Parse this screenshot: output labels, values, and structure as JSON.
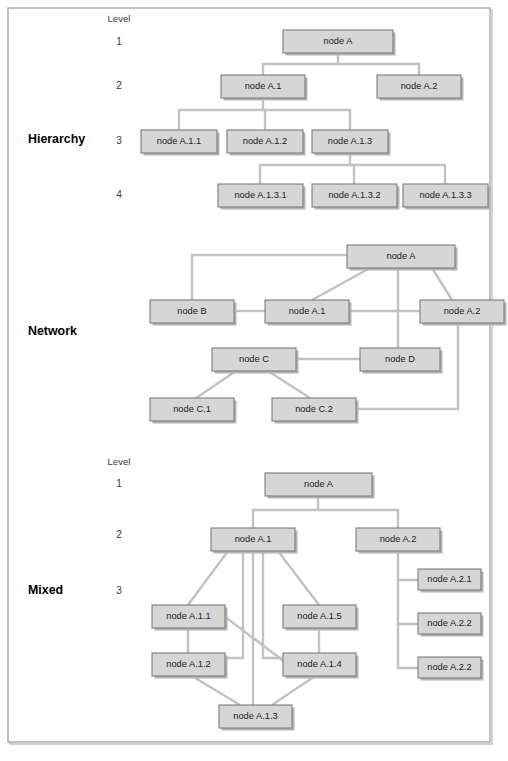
{
  "figure": {
    "width": 508,
    "height": 761,
    "colors": {
      "background": "#ffffff",
      "frame_border": "#9a9a9a",
      "node_fill": "#d6d6d6",
      "node_border": "#7d7d7d",
      "node_shadow": "#b4b4b4",
      "edge": "#c2c2c2",
      "label_text": "#1b1b1b",
      "row_title_text": "#000000",
      "level_text": "#3a3a3a"
    },
    "frame": {
      "x": 8,
      "y": 8,
      "width": 482,
      "height": 734
    }
  },
  "sections": [
    {
      "id": "hierarchy",
      "title": "Hierarchy",
      "title_pos": {
        "x": 28,
        "y": 140
      },
      "level_header": {
        "label": "Level",
        "x": 119,
        "y": 19
      },
      "levels": [
        {
          "label": "1",
          "x": 119,
          "y": 42
        },
        {
          "label": "2",
          "x": 119,
          "y": 86
        },
        {
          "label": "3",
          "x": 119,
          "y": 141
        },
        {
          "label": "4",
          "x": 119,
          "y": 195
        }
      ],
      "nodes": [
        {
          "id": "h-a",
          "label": "node A",
          "x": 283,
          "y": 30,
          "w": 110,
          "h": 23
        },
        {
          "id": "h-a1",
          "label": "node A.1",
          "x": 221,
          "y": 75,
          "w": 84,
          "h": 23
        },
        {
          "id": "h-a2",
          "label": "node A.2",
          "x": 377,
          "y": 75,
          "w": 84,
          "h": 23
        },
        {
          "id": "h-a11",
          "label": "node A.1.1",
          "x": 141,
          "y": 130,
          "w": 76,
          "h": 23
        },
        {
          "id": "h-a12",
          "label": "node A.1.2",
          "x": 227,
          "y": 130,
          "w": 76,
          "h": 23
        },
        {
          "id": "h-a13",
          "label": "node A.1.3",
          "x": 312,
          "y": 130,
          "w": 76,
          "h": 23
        },
        {
          "id": "h-a131",
          "label": "node A.1.3.1",
          "x": 218,
          "y": 184,
          "w": 85,
          "h": 23
        },
        {
          "id": "h-a132",
          "label": "node A.1.3.2",
          "x": 312,
          "y": 184,
          "w": 85,
          "h": 23
        },
        {
          "id": "h-a133",
          "label": "node A.1.3.3",
          "x": 403,
          "y": 184,
          "w": 85,
          "h": 23
        }
      ],
      "edges": [
        {
          "from": "h-a",
          "to": "h-a1",
          "type": "orthogonal"
        },
        {
          "from": "h-a",
          "to": "h-a2",
          "type": "orthogonal"
        },
        {
          "from": "h-a1",
          "to": "h-a11",
          "type": "orthogonal"
        },
        {
          "from": "h-a1",
          "to": "h-a12",
          "type": "orthogonal"
        },
        {
          "from": "h-a1",
          "to": "h-a13",
          "type": "orthogonal"
        },
        {
          "from": "h-a13",
          "to": "h-a131",
          "type": "orthogonal"
        },
        {
          "from": "h-a13",
          "to": "h-a132",
          "type": "orthogonal"
        },
        {
          "from": "h-a13",
          "to": "h-a133",
          "type": "orthogonal"
        }
      ],
      "edge_paths": [
        "M 338 53 L 338 64 L 263 64 L 263 75",
        "M 338 64 L 419 64 L 419 75",
        "M 263 98 L 263 110 L 179 110 L 179 130",
        "M 263 110 L 265 110 L 265 130",
        "M 263 110 L 350 110 L 350 130",
        "M 350 153 L 350 165 L 260 165 L 260 184",
        "M 350 165 L 354 165 L 354 184",
        "M 350 165 L 445 165 L 445 184"
      ]
    },
    {
      "id": "network",
      "title": "Network",
      "title_pos": {
        "x": 28,
        "y": 332
      },
      "level_header": null,
      "levels": [],
      "nodes": [
        {
          "id": "n-a",
          "label": "node A",
          "x": 347,
          "y": 245,
          "w": 108,
          "h": 23
        },
        {
          "id": "n-b",
          "label": "node B",
          "x": 150,
          "y": 300,
          "w": 84,
          "h": 23
        },
        {
          "id": "n-a1",
          "label": "node A.1",
          "x": 265,
          "y": 300,
          "w": 84,
          "h": 23
        },
        {
          "id": "n-a2",
          "label": "node A.2",
          "x": 420,
          "y": 300,
          "w": 84,
          "h": 23
        },
        {
          "id": "n-c",
          "label": "node C",
          "x": 212,
          "y": 348,
          "w": 84,
          "h": 23
        },
        {
          "id": "n-d",
          "label": "node D",
          "x": 360,
          "y": 348,
          "w": 80,
          "h": 23
        },
        {
          "id": "n-c1",
          "label": "node C.1",
          "x": 150,
          "y": 398,
          "w": 84,
          "h": 23
        },
        {
          "id": "n-c2",
          "label": "node C.2",
          "x": 272,
          "y": 398,
          "w": 84,
          "h": 23
        }
      ],
      "edges": [
        {
          "from": "n-a",
          "to": "n-b",
          "type": "orthogonal"
        },
        {
          "from": "n-a",
          "to": "n-a1",
          "type": "straight"
        },
        {
          "from": "n-a",
          "to": "n-a2",
          "type": "straight"
        },
        {
          "from": "n-a",
          "to": "n-d",
          "type": "straight"
        },
        {
          "from": "n-b",
          "to": "n-a1",
          "type": "straight"
        },
        {
          "from": "n-a1",
          "to": "n-a2",
          "type": "straight"
        },
        {
          "from": "n-c",
          "to": "n-d",
          "type": "straight"
        },
        {
          "from": "n-c",
          "to": "n-c1",
          "type": "straight"
        },
        {
          "from": "n-c",
          "to": "n-c2",
          "type": "straight"
        },
        {
          "from": "n-a2",
          "to": "n-c2",
          "type": "orthogonal"
        }
      ],
      "edge_paths": [
        "M 347 255 L 192 255 L 192 300",
        "M 370 268 L 312 300",
        "M 432 268 L 452 300",
        "M 398 268 L 398 348",
        "M 234 311 L 265 311",
        "M 349 311 L 420 311",
        "M 296 359 L 360 359",
        "M 236 371 L 196 398",
        "M 268 371 L 310 398",
        "M 458 323 L 458 409 L 356 409"
      ]
    },
    {
      "id": "mixed",
      "title": "Mixed",
      "title_pos": {
        "x": 28,
        "y": 591
      },
      "level_header": {
        "label": "Level",
        "x": 119,
        "y": 462
      },
      "levels": [
        {
          "label": "1",
          "x": 119,
          "y": 484
        },
        {
          "label": "2",
          "x": 119,
          "y": 535
        },
        {
          "label": "3",
          "x": 119,
          "y": 591
        }
      ],
      "nodes": [
        {
          "id": "m-a",
          "label": "node A",
          "x": 265,
          "y": 473,
          "w": 107,
          "h": 23
        },
        {
          "id": "m-a1",
          "label": "node A.1",
          "x": 211,
          "y": 528,
          "w": 84,
          "h": 23
        },
        {
          "id": "m-a2",
          "label": "node A.2",
          "x": 356,
          "y": 528,
          "w": 84,
          "h": 23
        },
        {
          "id": "m-a11",
          "label": "node A.1.1",
          "x": 152,
          "y": 605,
          "w": 73,
          "h": 23
        },
        {
          "id": "m-a15",
          "label": "node A.1.5",
          "x": 283,
          "y": 605,
          "w": 73,
          "h": 23
        },
        {
          "id": "m-a12",
          "label": "node A.1.2",
          "x": 152,
          "y": 653,
          "w": 73,
          "h": 23
        },
        {
          "id": "m-a14",
          "label": "node A.1.4",
          "x": 283,
          "y": 653,
          "w": 73,
          "h": 23
        },
        {
          "id": "m-a13",
          "label": "node A.1.3",
          "x": 219,
          "y": 705,
          "w": 73,
          "h": 23
        },
        {
          "id": "m-a21",
          "label": "node A.2.1",
          "x": 418,
          "y": 569,
          "w": 63,
          "h": 21
        },
        {
          "id": "m-a22a",
          "label": "node A.2.2",
          "x": 418,
          "y": 613,
          "w": 63,
          "h": 21
        },
        {
          "id": "m-a22b",
          "label": "node A.2.2",
          "x": 418,
          "y": 657,
          "w": 63,
          "h": 21
        }
      ],
      "edges": [
        {
          "from": "m-a",
          "to": "m-a1",
          "type": "orthogonal"
        },
        {
          "from": "m-a",
          "to": "m-a2",
          "type": "orthogonal"
        },
        {
          "from": "m-a1",
          "to": "m-a11",
          "type": "straight"
        },
        {
          "from": "m-a1",
          "to": "m-a12",
          "type": "straight"
        },
        {
          "from": "m-a1",
          "to": "m-a13",
          "type": "straight"
        },
        {
          "from": "m-a1",
          "to": "m-a14",
          "type": "straight"
        },
        {
          "from": "m-a1",
          "to": "m-a15",
          "type": "straight"
        },
        {
          "from": "m-a11",
          "to": "m-a12",
          "type": "straight"
        },
        {
          "from": "m-a11",
          "to": "m-a14",
          "type": "straight"
        },
        {
          "from": "m-a15",
          "to": "m-a14",
          "type": "straight"
        },
        {
          "from": "m-a12",
          "to": "m-a13",
          "type": "straight"
        },
        {
          "from": "m-a14",
          "to": "m-a13",
          "type": "straight"
        },
        {
          "from": "m-a2",
          "to": "m-a21",
          "type": "orthogonal"
        },
        {
          "from": "m-a2",
          "to": "m-a22a",
          "type": "orthogonal"
        },
        {
          "from": "m-a2",
          "to": "m-a22b",
          "type": "orthogonal"
        }
      ],
      "edge_paths": [
        "M 318 496 L 318 510 L 253 510 L 253 528",
        "M 318 510 L 398 510 L 398 528",
        "M 228 551 L 188 605",
        "M 243 551 L 243 658 L 225 658",
        "M 253 551 L 253 705",
        "M 263 551 L 263 658 L 283 658",
        "M 278 551 L 319 605",
        "M 188 628 L 188 653",
        "M 224 616 L 285 662",
        "M 319 628 L 319 653",
        "M 192 676 L 240 705",
        "M 315 676 L 272 705",
        "M 398 551 L 398 580 L 418 580",
        "M 398 580 L 398 624 L 418 624",
        "M 398 624 L 398 668 L 418 668"
      ]
    }
  ]
}
